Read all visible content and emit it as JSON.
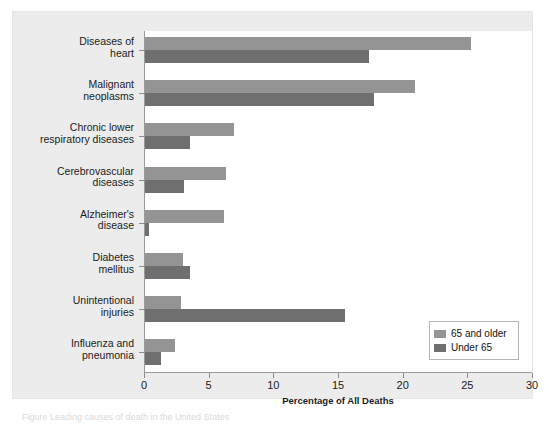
{
  "figure": {
    "panel_bg": "#ececec",
    "plot_bg": "#ffffff",
    "caption_fragment": "Figure  Leading causes of death in the United States"
  },
  "legend": {
    "position": "bottom-right",
    "entries": [
      {
        "label": "65 and older",
        "color": "#949494",
        "swatch": "legend-swatch-older"
      },
      {
        "label": "Under 65",
        "color": "#6f6f6f",
        "swatch": "legend-swatch-under"
      }
    ]
  },
  "chart_data": {
    "type": "bar",
    "orientation": "horizontal",
    "title": "",
    "subtitle": "",
    "xlabel": "Percentage of All Deaths",
    "ylabel": "",
    "xlim": [
      0,
      30
    ],
    "xticks": [
      0,
      5,
      10,
      15,
      20,
      25,
      30
    ],
    "xtick_labels": [
      "0",
      "5",
      "10",
      "15",
      "20",
      "25",
      "30"
    ],
    "grid": false,
    "legend_position": "bottom-right",
    "categories": [
      "Diseases of\nheart",
      "Malignant\nneoplasms",
      "Chronic lower\nrespiratory diseases",
      "Cerebrovascular\ndiseases",
      "Alzheimer's\ndisease",
      "Diabetes\nmellitus",
      "Unintentional\ninjuries",
      "Influenza and\npneumonia"
    ],
    "series": [
      {
        "name": "65 and older",
        "color": "#949494",
        "values": [
          25.2,
          20.9,
          6.9,
          6.3,
          6.1,
          2.9,
          2.8,
          2.3
        ]
      },
      {
        "name": "Under 65",
        "color": "#6f6f6f",
        "values": [
          17.3,
          17.7,
          3.5,
          3.0,
          0.3,
          3.5,
          15.5,
          1.2
        ]
      }
    ]
  }
}
